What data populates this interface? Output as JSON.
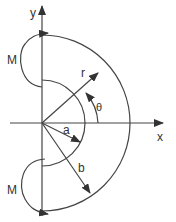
{
  "figure": {
    "axes": {
      "x_label": "x",
      "y_label": "y"
    },
    "labels": {
      "moment_top": "M",
      "moment_bottom": "M",
      "radius_r": "r",
      "angle_theta": "θ",
      "inner_radius": "a",
      "outer_radius": "b"
    },
    "colors": {
      "line": "#444444",
      "background": "#ffffff"
    }
  }
}
